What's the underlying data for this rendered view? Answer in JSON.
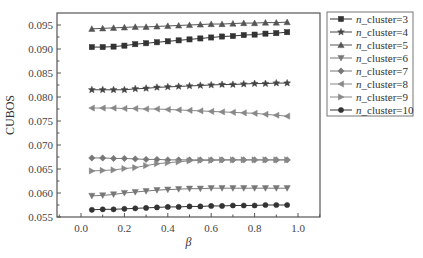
{
  "chart_data": {
    "type": "line",
    "title": "",
    "xlabel": "β",
    "ylabel": "CUBOS",
    "xlim": [
      -0.1,
      1.1
    ],
    "ylim": [
      0.055,
      0.097
    ],
    "xticks": [
      0.0,
      0.2,
      0.4,
      0.6,
      0.8,
      1.0
    ],
    "xtick_labels": [
      "0.0",
      "0.2",
      "0.4",
      "0.6",
      "0.8",
      "1.0"
    ],
    "yticks": [
      0.055,
      0.06,
      0.065,
      0.07,
      0.075,
      0.08,
      0.085,
      0.09,
      0.095
    ],
    "ytick_labels": [
      "0.055",
      "0.060",
      "0.065",
      "0.070",
      "0.075",
      "0.080",
      "0.085",
      "0.090",
      "0.095"
    ],
    "grid": false,
    "legend_position": "outside-right-top",
    "x": [
      0.05,
      0.1,
      0.15,
      0.2,
      0.25,
      0.3,
      0.35,
      0.4,
      0.45,
      0.5,
      0.55,
      0.6,
      0.65,
      0.7,
      0.75,
      0.8,
      0.85,
      0.9,
      0.95
    ],
    "series": [
      {
        "name": "n_cluster=3",
        "label_italic": "n",
        "label_rest": "_cluster=3",
        "marker": "square",
        "color": "#333333",
        "values": [
          0.0904,
          0.0904,
          0.0905,
          0.0907,
          0.091,
          0.0912,
          0.0914,
          0.0916,
          0.0918,
          0.092,
          0.0922,
          0.0924,
          0.0926,
          0.0927,
          0.0929,
          0.093,
          0.0932,
          0.0933,
          0.0935
        ]
      },
      {
        "name": "n_cluster=4",
        "label_italic": "n",
        "label_rest": "_cluster=4",
        "marker": "star",
        "color": "#444444",
        "values": [
          0.0815,
          0.0815,
          0.0815,
          0.0815,
          0.0817,
          0.0818,
          0.082,
          0.0821,
          0.0822,
          0.0823,
          0.0824,
          0.0825,
          0.0826,
          0.0826,
          0.0827,
          0.0828,
          0.0828,
          0.0829,
          0.0829
        ]
      },
      {
        "name": "n_cluster=5",
        "label_italic": "n",
        "label_rest": "_cluster=5",
        "marker": "triangle-up",
        "color": "#555555",
        "values": [
          0.0942,
          0.0943,
          0.0944,
          0.0945,
          0.0946,
          0.0946,
          0.0947,
          0.0948,
          0.0949,
          0.095,
          0.0951,
          0.0952,
          0.0952,
          0.0953,
          0.0954,
          0.0954,
          0.0955,
          0.0955,
          0.0956
        ]
      },
      {
        "name": "n_cluster=6",
        "label_italic": "n",
        "label_rest": "_cluster=6",
        "marker": "triangle-down",
        "color": "#777777",
        "values": [
          0.0594,
          0.0595,
          0.0597,
          0.06,
          0.0602,
          0.0604,
          0.0606,
          0.0607,
          0.0608,
          0.0609,
          0.0609,
          0.061,
          0.061,
          0.061,
          0.061,
          0.061,
          0.061,
          0.061,
          0.061
        ]
      },
      {
        "name": "n_cluster=7",
        "label_italic": "n",
        "label_rest": "_cluster=7",
        "marker": "diamond",
        "color": "#777777",
        "values": [
          0.0673,
          0.0673,
          0.0672,
          0.0672,
          0.0671,
          0.067,
          0.067,
          0.0669,
          0.0669,
          0.0669,
          0.0669,
          0.0669,
          0.0669,
          0.0669,
          0.0669,
          0.0669,
          0.0669,
          0.0669,
          0.0669
        ]
      },
      {
        "name": "n_cluster=8",
        "label_italic": "n",
        "label_rest": "_cluster=8",
        "marker": "triangle-left",
        "color": "#888888",
        "values": [
          0.0777,
          0.0777,
          0.0777,
          0.0776,
          0.0776,
          0.0775,
          0.0775,
          0.0774,
          0.0773,
          0.0772,
          0.0771,
          0.077,
          0.0769,
          0.0768,
          0.0767,
          0.0766,
          0.0764,
          0.0762,
          0.076
        ]
      },
      {
        "name": "n_cluster=9",
        "label_italic": "n",
        "label_rest": "_cluster=9",
        "marker": "triangle-right",
        "color": "#888888",
        "values": [
          0.0646,
          0.0647,
          0.0648,
          0.0651,
          0.0653,
          0.0657,
          0.0661,
          0.0663,
          0.0665,
          0.0667,
          0.0668,
          0.0668,
          0.0669,
          0.0669,
          0.0669,
          0.0669,
          0.0669,
          0.0669,
          0.0669
        ]
      },
      {
        "name": "n_cluster=10",
        "label_italic": "n",
        "label_rest": "_cluster=10",
        "marker": "circle",
        "color": "#333333",
        "values": [
          0.0565,
          0.0566,
          0.0566,
          0.0567,
          0.0568,
          0.0569,
          0.057,
          0.0571,
          0.0571,
          0.0572,
          0.0572,
          0.0573,
          0.0573,
          0.0574,
          0.0574,
          0.0574,
          0.0575,
          0.0575,
          0.0575
        ]
      }
    ]
  },
  "layout": {
    "plot": {
      "left": 57,
      "top": 13,
      "right": 320,
      "bottom": 217
    },
    "x_px": {
      "v0": 0.0,
      "p0": 81,
      "v1": 1.0,
      "p1": 298
    },
    "y_px": {
      "v0": 0.055,
      "p0": 217,
      "v1": 0.095,
      "p1": 25
    },
    "legend": {
      "left": 327,
      "top": 12,
      "right": 413,
      "bottom": 116,
      "row_h": 13
    }
  }
}
